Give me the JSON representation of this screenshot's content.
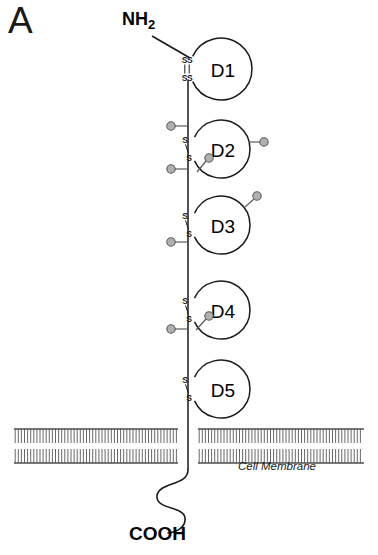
{
  "figure": {
    "panel_letter": "A",
    "background_color": "#ffffff",
    "line_color": "#1a1a1a",
    "glycan_fill": "#b0b0b0",
    "glycan_stroke": "#5a5a5a",
    "membrane_color": "#4d4d4d"
  },
  "terminals": {
    "n_terminus": "NH",
    "n_terminus_subscript": "2",
    "c_terminus": "COOH"
  },
  "membrane": {
    "label": "Cell Membrane"
  },
  "domains": [
    {
      "label": "D1",
      "cx": 221,
      "cy": 69,
      "r": 31,
      "disulfide": "double",
      "disulfide_top_text": "SS",
      "disulfide_bottom_text": "SS",
      "glycans": []
    },
    {
      "label": "D2",
      "cx": 221,
      "cy": 149,
      "r": 29,
      "disulfide": "single",
      "disulfide_top_text": "S",
      "disulfide_bottom_text": "S",
      "glycans": [
        {
          "x1": 188,
          "y1": 126,
          "x2": 174,
          "y2": 126,
          "cx": 171,
          "cy": 126,
          "r": 4.2
        },
        {
          "x1": 188,
          "y1": 169,
          "x2": 174,
          "y2": 169,
          "cx": 171,
          "cy": 169,
          "r": 4.2
        },
        {
          "x1": 249,
          "y1": 142,
          "x2": 260,
          "y2": 142,
          "cx": 264,
          "cy": 142,
          "r": 4.2
        },
        {
          "x1": 197,
          "y1": 172,
          "x2": 206,
          "y2": 161,
          "cx": 209,
          "cy": 158,
          "r": 4.2
        }
      ]
    },
    {
      "label": "D3",
      "cx": 221,
      "cy": 225,
      "r": 29,
      "disulfide": "single",
      "disulfide_top_text": "S",
      "disulfide_bottom_text": "S",
      "glycans": [
        {
          "x1": 245,
          "y1": 207,
          "x2": 254,
          "y2": 199,
          "cx": 257,
          "cy": 196,
          "r": 4.2
        },
        {
          "x1": 188,
          "y1": 242,
          "x2": 174,
          "y2": 242,
          "cx": 171,
          "cy": 242,
          "r": 4.2
        }
      ]
    },
    {
      "label": "D4",
      "cx": 221,
      "cy": 310,
      "r": 29,
      "disulfide": "single",
      "disulfide_top_text": "S",
      "disulfide_bottom_text": "S",
      "glycans": [
        {
          "x1": 196,
          "y1": 330,
          "x2": 206,
          "y2": 319,
          "cx": 209,
          "cy": 316,
          "r": 4.2
        },
        {
          "x1": 188,
          "y1": 329,
          "x2": 174,
          "y2": 329,
          "cx": 171,
          "cy": 329,
          "r": 4.2
        }
      ]
    },
    {
      "label": "D5",
      "cx": 221,
      "cy": 389,
      "r": 29,
      "disulfide": "single",
      "disulfide_top_text": "S",
      "disulfide_bottom_text": "S",
      "glycans": []
    }
  ]
}
